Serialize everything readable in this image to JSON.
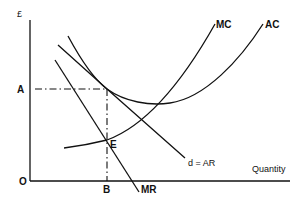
{
  "diagram": {
    "type": "economics-cost-revenue",
    "axes": {
      "y_label": "£",
      "x_label": "Quantity",
      "origin_label": "O"
    },
    "points": {
      "price_label": "A",
      "quantity_label": "B",
      "equilibrium_label": "E"
    },
    "curves": [
      {
        "id": "mc",
        "label": "MC"
      },
      {
        "id": "ac",
        "label": "AC"
      },
      {
        "id": "ar",
        "label": "d = AR"
      },
      {
        "id": "mr",
        "label": "MR"
      }
    ],
    "colors": {
      "ink": "#111111",
      "background": "#ffffff"
    }
  }
}
